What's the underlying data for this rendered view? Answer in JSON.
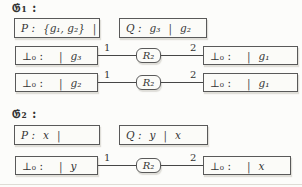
{
  "figure": {
    "colors": {
      "background": "#fcfcfa",
      "box_border": "#595959",
      "text": "#343434",
      "edge_line": "#464646"
    },
    "groups": [
      {
        "label": "𝔊₁ :",
        "p_box": {
          "name": "P :",
          "left": "{g₁, g₂}",
          "sep": "|",
          "right": ""
        },
        "q_box": {
          "name": "Q :",
          "left": "g₃",
          "sep": "|",
          "right": "g₂"
        },
        "rows": [
          {
            "left_box": {
              "name": "⊥₀ :",
              "left": "",
              "sep": "|",
              "right": "g₃"
            },
            "edge1_label": "1",
            "node": "R₂",
            "edge2_label": "2",
            "right_box": {
              "name": "⊥₀ :",
              "left": "",
              "sep": "|",
              "right": "g₁"
            }
          },
          {
            "left_box": {
              "name": "⊥₀ :",
              "left": "",
              "sep": "|",
              "right": "g₂"
            },
            "edge1_label": "1",
            "node": "R₂",
            "edge2_label": "2",
            "right_box": {
              "name": "⊥₀ :",
              "left": "",
              "sep": "|",
              "right": "g₁"
            }
          }
        ]
      },
      {
        "label": "𝔊₂ :",
        "p_box": {
          "name": "P :",
          "left": "x",
          "sep": "|",
          "right": ""
        },
        "q_box": {
          "name": "Q :",
          "left": "y",
          "sep": "|",
          "right": "x"
        },
        "rows": [
          {
            "left_box": {
              "name": "⊥₀ :",
              "left": "",
              "sep": "|",
              "right": "y"
            },
            "edge1_label": "1",
            "node": "R₂",
            "edge2_label": "2",
            "right_box": {
              "name": "⊥₀ :",
              "left": "",
              "sep": "|",
              "right": "x"
            }
          }
        ]
      }
    ]
  }
}
